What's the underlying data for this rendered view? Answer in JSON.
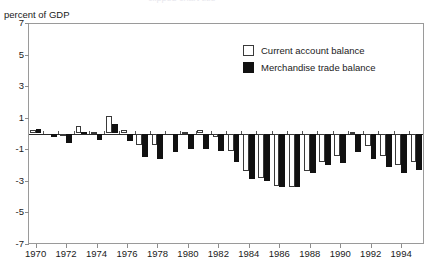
{
  "axis_label": {
    "y": "percent of GDP"
  },
  "title_remnant": "clipped chart title",
  "legend": {
    "position": "inside-top-right",
    "entries": [
      {
        "label": "Current account balance",
        "swatch": "hollow-white-square",
        "color": "#ffffff"
      },
      {
        "label": "Merchandise trade balance",
        "swatch": "solid-black-square",
        "color": "#111111"
      }
    ]
  },
  "chart_data": {
    "type": "bar",
    "title": "",
    "subtitle": "",
    "xlabel": "",
    "ylabel": "percent of GDP",
    "ylim": [
      -7,
      7
    ],
    "yticks": [
      7,
      5,
      3,
      1,
      -1,
      -3,
      -5,
      -7
    ],
    "xticks": [
      1970,
      1972,
      1974,
      1976,
      1978,
      1980,
      1982,
      1984,
      1986,
      1988,
      1990,
      1992,
      1994
    ],
    "grid": false,
    "zero_line": true,
    "legend_position": "inside-top-right",
    "categories": [
      1970,
      1971,
      1972,
      1973,
      1974,
      1975,
      1976,
      1977,
      1978,
      1979,
      1980,
      1981,
      1982,
      1983,
      1984,
      1985,
      1986,
      1987,
      1988,
      1989,
      1990,
      1991,
      1992,
      1993,
      1994,
      1995
    ],
    "series": [
      {
        "name": "Current account balance",
        "color": "#ffffff",
        "values": [
          0.2,
          0.0,
          -0.1,
          0.5,
          0.1,
          1.1,
          0.2,
          -0.7,
          -0.7,
          0.0,
          0.1,
          0.2,
          -0.2,
          -1.1,
          -2.4,
          -2.8,
          -3.3,
          -3.4,
          -2.4,
          -1.8,
          -1.4,
          0.1,
          -0.8,
          -1.4,
          -2.0,
          -1.8
        ]
      },
      {
        "name": "Merchandise trade balance",
        "color": "#111111",
        "values": [
          0.3,
          -0.2,
          -0.6,
          0.1,
          -0.4,
          0.6,
          -0.5,
          -1.5,
          -1.6,
          -1.2,
          -1.0,
          -1.0,
          -1.1,
          -1.8,
          -2.9,
          -3.0,
          -3.4,
          -3.4,
          -2.5,
          -2.0,
          -1.9,
          -1.2,
          -1.6,
          -2.1,
          -2.5,
          -2.3
        ]
      }
    ]
  }
}
